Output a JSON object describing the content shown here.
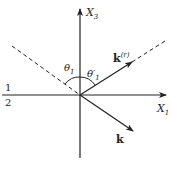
{
  "diagram": {
    "axes": {
      "vertical_label": "X",
      "vertical_sub": "3",
      "horizontal_label": "X",
      "horizontal_sub": "1"
    },
    "media": {
      "upper": "1",
      "lower": "2"
    },
    "angles": {
      "incident": "θ",
      "incident_sub": "1",
      "reflected": "θ′",
      "reflected_sub": "1"
    },
    "vectors": {
      "reflected": "k",
      "reflected_sup": "(r)",
      "transmitted": "k"
    },
    "colors": {
      "ink": "#222222",
      "background": "#ffffff"
    }
  }
}
